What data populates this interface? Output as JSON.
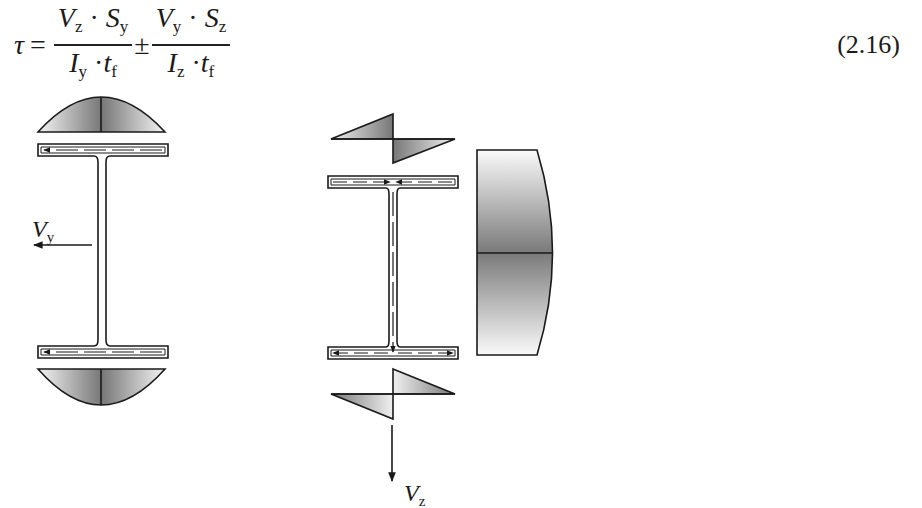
{
  "equation": {
    "lhs": "τ",
    "equals": "=",
    "term1": {
      "numerator": [
        "V",
        "z",
        "S",
        "y"
      ],
      "denominator": [
        "I",
        "y",
        "t",
        "f"
      ]
    },
    "operator": "±",
    "term2": {
      "numerator": [
        "V",
        "y",
        "S",
        "z"
      ],
      "denominator": [
        "I",
        "z",
        "t",
        "f"
      ]
    },
    "dot": "·",
    "number": "(2.16)"
  },
  "figure": {
    "left_section": {
      "force_label": "V",
      "force_sub": "y",
      "flow_direction": "leftward in both flanges",
      "stress_diagram": "parabolic over flange width"
    },
    "right_section": {
      "force_label": "V",
      "force_sub": "z",
      "flow_direction": "top flange inward, down web, bottom flange outward",
      "flange_stress_diagram": "antisymmetric linear (zigzag)",
      "web_stress_diagram": "parabolic over web height"
    },
    "colors": {
      "stroke": "#1a1a1a",
      "shade_dark": "#7a7a7a",
      "shade_light": "#f2f2f2"
    }
  }
}
